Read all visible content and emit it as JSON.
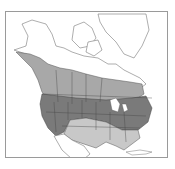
{
  "map": {
    "type": "species-range-map",
    "region": "North America",
    "colors": {
      "background": "#ffffff",
      "frame": "#9a9a9a",
      "outline": "#555555",
      "outside_range": "#ffffff",
      "breeding_range": "#a8a8a8",
      "year_round_range": "#7a7a7a",
      "winter_range": "#c8c8c8"
    },
    "zones": [
      {
        "name": "breeding",
        "description": "Canada and Alaska coast band, medium gray"
      },
      {
        "name": "year_round",
        "description": "Northern and western United States, dark gray"
      },
      {
        "name": "winter",
        "description": "Southern United States and northern Mexico, light gray"
      }
    ]
  }
}
